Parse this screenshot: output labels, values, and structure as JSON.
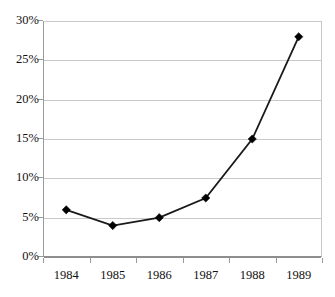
{
  "chart_data": {
    "type": "line",
    "title": "",
    "subtitle": "",
    "xlabel": "",
    "ylabel": "",
    "categories": [
      "1984",
      "1985",
      "1986",
      "1987",
      "1988",
      "1989"
    ],
    "values": [
      6,
      4,
      5,
      7.5,
      15,
      28
    ],
    "series": [
      {
        "name": "",
        "values": [
          6,
          4,
          5,
          7.5,
          15,
          28
        ]
      }
    ],
    "ylim": [
      0,
      30
    ],
    "ytick_values": [
      0,
      5,
      10,
      15,
      20,
      25,
      30
    ],
    "ytick_labels": [
      "0%",
      "5%",
      "10%",
      "15%",
      "20%",
      "25%",
      "30%"
    ],
    "xtick_labels": [
      "1984",
      "1985",
      "1986",
      "1987",
      "1988",
      "1989"
    ],
    "grid": true,
    "grid_axis": "y",
    "legend": false,
    "legend_position": "none",
    "marker": "diamond",
    "line_color": "#1a1a1a",
    "marker_color": "#000000",
    "grid_color": "#c9c9c9",
    "axis_color": "#8e8e8e",
    "background_color": "#ffffff",
    "annotations": []
  }
}
